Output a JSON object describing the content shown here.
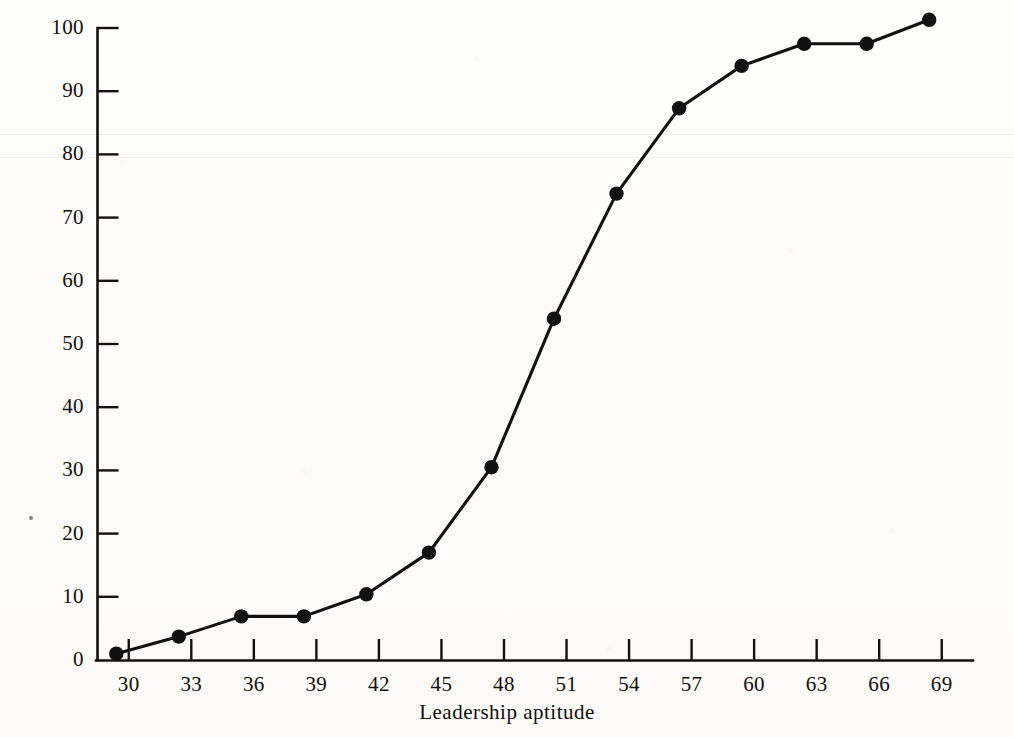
{
  "chart_data": {
    "type": "line",
    "title": "",
    "subtitle": "",
    "xlabel": "Leadership aptitude",
    "ylabel": "Cumulative percentage frequency",
    "xlim": [
      28.5,
      70.5
    ],
    "ylim": [
      0,
      100
    ],
    "xticks": [
      30,
      33,
      36,
      39,
      42,
      45,
      48,
      51,
      54,
      57,
      60,
      63,
      66,
      69
    ],
    "yticks": [
      0,
      10,
      20,
      30,
      40,
      50,
      60,
      70,
      80,
      90,
      100
    ],
    "xtick_labels": [
      "30",
      "33",
      "36",
      "39",
      "42",
      "45",
      "48",
      "51",
      "54",
      "57",
      "60",
      "63",
      "66",
      "69"
    ],
    "ytick_labels": [
      "0",
      "10",
      "20",
      "30",
      "40",
      "50",
      "60",
      "70",
      "80",
      "90",
      "100"
    ],
    "grid": false,
    "legend": null,
    "tick_direction": "inward",
    "marker": "filled-circle",
    "line_color": "#111111",
    "marker_color": "#111111",
    "background_color": "#fdfdfc",
    "series": [
      {
        "name": "Cumulative percentage frequency",
        "x": [
          29.4,
          32.4,
          35.4,
          38.4,
          41.4,
          44.4,
          47.4,
          50.4,
          53.4,
          56.4,
          59.4,
          62.4,
          65.4,
          68.4
        ],
        "values": [
          1,
          3.7,
          6.9,
          6.9,
          10.4,
          17,
          30.5,
          54,
          73.8,
          87.3,
          94,
          97.5,
          97.5,
          101.3
        ],
        "point_labels": [
          "1",
          "3.7",
          "6.9",
          "6.9",
          "10.4",
          "17",
          "30.5",
          "54",
          "73.8",
          "87.3",
          "94",
          "97.5",
          "97.5",
          "101.3"
        ]
      }
    ]
  },
  "figure": {
    "caption": "",
    "annotations": []
  }
}
